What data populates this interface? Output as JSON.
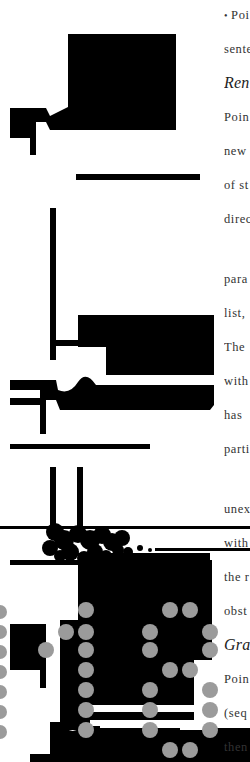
{
  "figure": {
    "colors": {
      "ink": "#000000",
      "dot": "#9b9b9b",
      "paper": "#ffffff"
    }
  },
  "text_column": {
    "lines": [
      {
        "text": "Poi",
        "y": 18,
        "bullet": "•"
      },
      {
        "text": "sente",
        "y": 52
      },
      {
        "text": "Ren",
        "y": 86,
        "heading": true
      },
      {
        "text": "Poin",
        "y": 120
      },
      {
        "text": "new",
        "y": 154
      },
      {
        "text": "of st",
        "y": 188
      },
      {
        "text": "direc",
        "y": 222
      },
      {
        "text": "para",
        "y": 282
      },
      {
        "text": "list,",
        "y": 316
      },
      {
        "text": "The",
        "y": 350
      },
      {
        "text": "with",
        "y": 384
      },
      {
        "text": "has",
        "y": 418
      },
      {
        "text": "parti",
        "y": 452
      },
      {
        "text": "unex",
        "y": 512
      },
      {
        "text": "with",
        "y": 546
      },
      {
        "text": "the r",
        "y": 580
      },
      {
        "text": "obst",
        "y": 614
      },
      {
        "text": "Gra",
        "y": 648,
        "heading": true
      },
      {
        "text": "Poin",
        "y": 682
      },
      {
        "text": "(seq",
        "y": 716
      },
      {
        "text": "then",
        "y": 750
      },
      {
        "text": "para",
        "y": 784
      }
    ]
  }
}
